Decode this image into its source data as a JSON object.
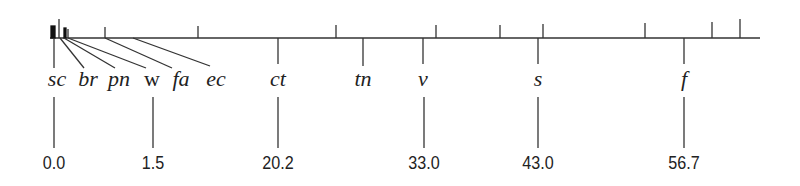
{
  "diagram": {
    "type": "number-line-labeling",
    "axis": {
      "x_start": 50,
      "x_end": 760,
      "y": 38
    },
    "upper_ticks_x": [
      59,
      66,
      68,
      105,
      198,
      336,
      436,
      500,
      543,
      645,
      712,
      740
    ],
    "symbols": [
      {
        "text": "sc",
        "x": 57
      },
      {
        "text": "br",
        "x": 88
      },
      {
        "text": "pn",
        "x": 119
      },
      {
        "text": "w",
        "x": 150
      },
      {
        "text": "fa",
        "x": 181
      },
      {
        "text": "ec",
        "x": 216
      },
      {
        "text": "ct",
        "x": 278
      },
      {
        "text": "tn",
        "x": 363
      },
      {
        "text": "v",
        "x": 423
      },
      {
        "text": "s",
        "x": 538
      },
      {
        "text": "f",
        "x": 684
      }
    ],
    "values": [
      {
        "text": "0.0",
        "x": 54
      },
      {
        "text": "1.5",
        "x": 153
      },
      {
        "text": "20.2",
        "x": 278
      },
      {
        "text": "33.0",
        "x": 424
      },
      {
        "text": "43.0",
        "x": 538
      },
      {
        "text": "56.7",
        "x": 684
      }
    ]
  }
}
